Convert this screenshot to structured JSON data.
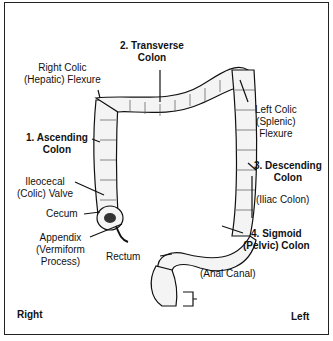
{
  "diagram": {
    "labels": {
      "transverse": [
        "2. Transverse",
        "Colon"
      ],
      "hepatic": [
        "Right Colic",
        "(Hepatic) Flexure"
      ],
      "splenic": [
        "Left Colic",
        "(Splenic)",
        "Flexure"
      ],
      "ascending": [
        "1. Ascending",
        "Colon"
      ],
      "descending": [
        "3. Descending",
        "Colon"
      ],
      "iliac": "(Iliac Colon)",
      "ileocecal": [
        "Ileocecal",
        "(Colic) Valve"
      ],
      "cecum": "Cecum",
      "appendix": [
        "Appendix",
        "(Vermiform",
        "Process)"
      ],
      "rectum": "Rectum",
      "sigmoid": [
        "4. Sigmoid",
        "(Pelvic) Colon"
      ],
      "anal": "(Anal Canal)",
      "right": "Right",
      "left": "Left"
    }
  }
}
